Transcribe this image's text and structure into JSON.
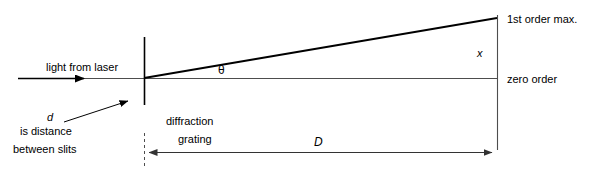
{
  "figure": {
    "title_present": false,
    "kind": "optics-ray-diagram",
    "canvas": {
      "width": 594,
      "height": 172
    },
    "colors": {
      "background": "#ffffff",
      "ray_stroke": "#000000",
      "axis_stroke": "#4d4d4d",
      "text": "#000000",
      "dimension_stroke": "#4d4d4d"
    }
  },
  "labels": {
    "light_from_laser": "light from laser",
    "theta_symbol": "θ",
    "first_order_max": "1st order max.",
    "zero_order": "zero order",
    "x_symbol": "x",
    "d_symbol": "d",
    "d_description_line1": "is distance",
    "d_description_line2": "between slits",
    "grating_line1": "diffraction",
    "grating_line2": "grating",
    "D_symbol": "D"
  },
  "geometry": {
    "optical_axis": {
      "x1": 18,
      "y1": 78,
      "x2": 497,
      "y2": 78
    },
    "grating_line": {
      "x": 144,
      "y1": 37,
      "y2": 105
    },
    "screen_line": {
      "x": 497,
      "y1": 15,
      "y2": 150
    },
    "first_order_ray": {
      "x1": 144,
      "y1": 78,
      "x2": 497,
      "y2": 18
    },
    "laser_arrow": {
      "x1": 18,
      "y1": 78,
      "x2": 88,
      "y2": 78
    },
    "d_pointer_arrow": {
      "x1": 64,
      "y1": 122,
      "x2": 131,
      "y2": 100
    },
    "x_dimension": {
      "x": 497,
      "y1": 18,
      "y2": 78
    },
    "D_dimension": {
      "x1": 145,
      "x2": 496,
      "y": 152
    },
    "grating_dashed_extension": {
      "x": 144,
      "y1": 133,
      "y2": 168
    }
  }
}
